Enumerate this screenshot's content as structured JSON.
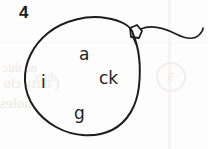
{
  "worksheet": {
    "item_number": "4",
    "ink_color": "#1f1f1f",
    "background_color": "#fdfdfd"
  },
  "drawing": {
    "shape_name": "balloon",
    "outline_color": "#1c1c1c",
    "outline_width": 2,
    "knot_name": "balloon-knot",
    "string_name": "balloon-string"
  },
  "letters": {
    "top": "a",
    "left": "i",
    "right": "ck",
    "bottom": "g"
  },
  "ghost_text": {
    "line_a": "ne thic",
    "line_b": "( dirty clo",
    "line_c": "holes",
    "line_d": "dirty",
    "circled_number": "5"
  }
}
